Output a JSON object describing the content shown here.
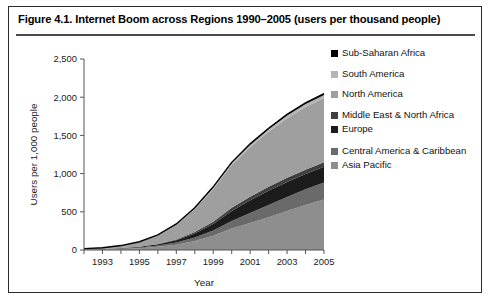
{
  "figure": {
    "title": "Figure 4.1. Internet Boom across Regions 1990–2005 (users per thousand people)"
  },
  "chart_data": {
    "type": "area",
    "title": "Figure 4.1. Internet Boom across Regions 1990–2005 (users per thousand people)",
    "stacked": true,
    "xlabel": "Year",
    "ylabel": "Users per 1,000 people",
    "xlim": [
      1992,
      2005
    ],
    "ylim": [
      0,
      2500
    ],
    "yticks": [
      0,
      500,
      1000,
      1500,
      2000,
      2500
    ],
    "ytick_labels": [
      "0",
      "500",
      "1,000",
      "1,500",
      "2,000",
      "2,500"
    ],
    "xticks": [
      1992,
      1993,
      1994,
      1995,
      1996,
      1997,
      1998,
      1999,
      2000,
      2001,
      2002,
      2003,
      2004,
      2005
    ],
    "xtick_labels": [
      "",
      "1993",
      "",
      "1995",
      "",
      "1997",
      "",
      "1999",
      "",
      "2001",
      "",
      "2003",
      "",
      "2005"
    ],
    "grid": false,
    "legend_position": "right",
    "x": [
      1992,
      1993,
      1994,
      1995,
      1996,
      1997,
      1998,
      1999,
      2000,
      2001,
      2002,
      2003,
      2004,
      2005
    ],
    "series": [
      {
        "name": "Asia Pacific",
        "color": "#8e8e8e",
        "stack_order": 1,
        "values": [
          5,
          8,
          14,
          24,
          42,
          70,
          118,
          185,
          280,
          355,
          430,
          510,
          590,
          660
        ]
      },
      {
        "name": "Central America & Caribbean",
        "color": "#6a6a6a",
        "stack_order": 2,
        "values": [
          2,
          3,
          5,
          9,
          16,
          28,
          45,
          70,
          100,
          130,
          160,
          185,
          205,
          225
        ]
      },
      {
        "name": "Europe",
        "color": "#1c1c1c",
        "stack_order": 3,
        "values": [
          1,
          2,
          4,
          8,
          16,
          30,
          52,
          85,
          130,
          165,
          185,
          195,
          200,
          205
        ]
      },
      {
        "name": "Middle East & North Africa",
        "color": "#3f3f3f",
        "stack_order": 4,
        "values": [
          1,
          1,
          2,
          3,
          6,
          11,
          19,
          30,
          42,
          48,
          52,
          55,
          57,
          60
        ]
      },
      {
        "name": "North America",
        "color": "#9f9f9f",
        "stack_order": 5,
        "values": [
          8,
          15,
          30,
          60,
          110,
          190,
          300,
          430,
          560,
          650,
          720,
          780,
          820,
          840
        ]
      },
      {
        "name": "South America",
        "color": "#b5b5b5",
        "stack_order": 6,
        "values": [
          1,
          1,
          2,
          3,
          5,
          9,
          14,
          20,
          26,
          30,
          34,
          36,
          38,
          40
        ]
      },
      {
        "name": "Sub-Saharan Africa",
        "color": "#000000",
        "stack_order": 7,
        "values": [
          0,
          0,
          1,
          1,
          2,
          3,
          5,
          7,
          9,
          11,
          13,
          15,
          17,
          18
        ]
      }
    ],
    "totals_2005": 2048,
    "legend_entries": [
      {
        "label": "Sub-Saharan Africa",
        "color": "#000000"
      },
      {
        "label": "South America",
        "color": "#b5b5b5"
      },
      {
        "label": "North America",
        "color": "#9f9f9f"
      },
      {
        "label": "Middle East & North Africa",
        "color": "#3f3f3f"
      },
      {
        "label": "Europe",
        "color": "#1c1c1c"
      },
      {
        "label": "Central America & Caribbean",
        "color": "#6a6a6a"
      },
      {
        "label": "Asia Pacific",
        "color": "#8e8e8e"
      }
    ]
  }
}
